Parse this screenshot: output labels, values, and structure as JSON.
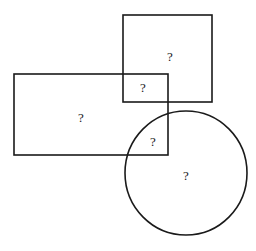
{
  "diagram": {
    "type": "venn-like shape overlap",
    "stroke_color": "#1a1a1a",
    "shapes": {
      "square": {
        "x": 123,
        "y": 15,
        "width": 89,
        "height": 87
      },
      "rectangle": {
        "x": 14,
        "y": 74,
        "width": 154,
        "height": 81
      },
      "circle": {
        "cx": 186,
        "cy": 173,
        "rx": 61,
        "ry": 62
      }
    },
    "regions": [
      {
        "name": "square-only",
        "label": "?",
        "x": 170,
        "y": 61
      },
      {
        "name": "square-rectangle-overlap",
        "label": "?",
        "x": 143,
        "y": 92
      },
      {
        "name": "rectangle-only",
        "label": "?",
        "x": 81,
        "y": 122
      },
      {
        "name": "rectangle-circle-overlap",
        "label": "?",
        "x": 153,
        "y": 146
      },
      {
        "name": "circle-only",
        "label": "?",
        "x": 186,
        "y": 180
      }
    ]
  }
}
